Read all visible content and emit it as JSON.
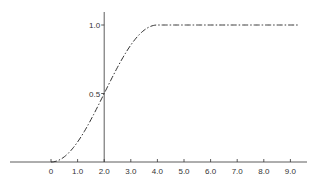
{
  "chart_data": {
    "type": "line",
    "title": "",
    "xlabel": "",
    "ylabel": "",
    "xlim": [
      -1.5,
      9.5
    ],
    "ylim": [
      0,
      1.1
    ],
    "grid": false,
    "legend": null,
    "x_ticks": [
      0,
      1.0,
      2.0,
      3.0,
      4.0,
      5.0,
      6.0,
      7.0,
      8.0,
      9.0
    ],
    "x_tick_labels": [
      "0",
      "1.0",
      "2.0",
      "3.0",
      "4.0",
      "5.0",
      "6.0",
      "7.0",
      "8.0",
      "9.0"
    ],
    "y_ticks": [
      0.5,
      1.0
    ],
    "y_tick_labels": [
      "0.5",
      "1.0"
    ],
    "y_axis_at_x": 2.0,
    "series": [
      {
        "name": "curve",
        "line_style": "dash-dot",
        "x": [
          0,
          0.5,
          1.0,
          1.5,
          2.0,
          2.5,
          3.0,
          3.5,
          4.0,
          5.0,
          6.0,
          7.0,
          8.0,
          9.0
        ],
        "values": [
          0,
          0.04,
          0.15,
          0.31,
          0.5,
          0.69,
          0.85,
          0.96,
          1.0,
          1.0,
          1.0,
          1.0,
          1.0,
          1.0
        ]
      }
    ]
  },
  "colors": {
    "line": "#333333",
    "background": "#ffffff"
  }
}
